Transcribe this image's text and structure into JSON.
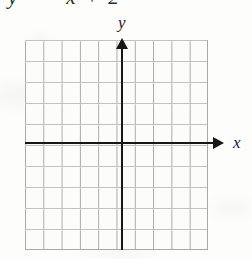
{
  "figure": {
    "clipped_equation_text": "y = −x + 2",
    "axis_labels": {
      "x": "x",
      "y": "y"
    }
  },
  "chart_data": {
    "type": "scatter",
    "title": "",
    "xlabel": "x",
    "ylabel": "y",
    "grid": true,
    "legend": null,
    "annotations": [],
    "series": [],
    "x": [],
    "values": [],
    "xlim": [
      -5,
      5
    ],
    "ylim": [
      -5,
      5
    ],
    "x_gridlines": 10,
    "y_gridlines": 10,
    "xticklabels": [],
    "yticklabels": []
  },
  "colors": {
    "grid_line": "#a9a9a9",
    "axis_line": "#171717",
    "paper": "#fdfdfc",
    "text": "#1c1c1c"
  }
}
